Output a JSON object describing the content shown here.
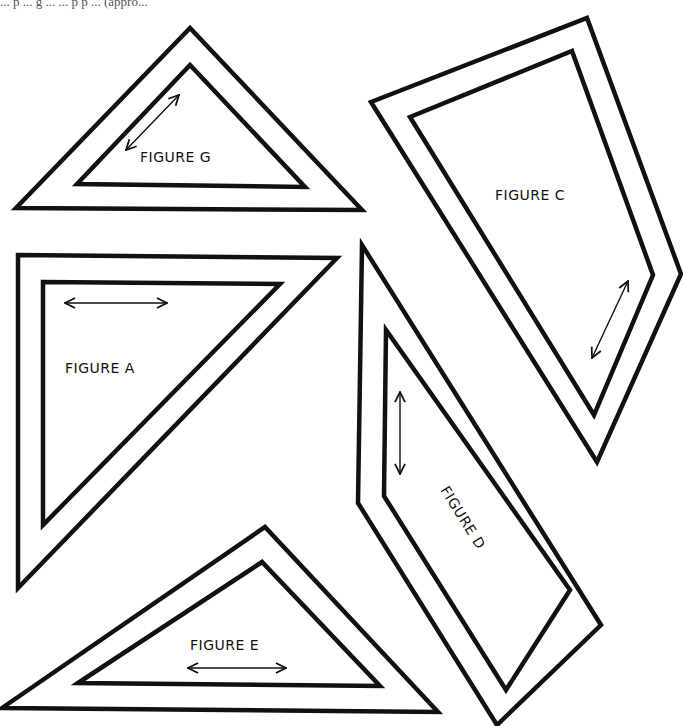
{
  "caption": "... p ... g ... ... p p ... (appro...",
  "colors": {
    "ink": "#111111",
    "paper": "#ffffff"
  },
  "figures": [
    {
      "id": "G",
      "label": "FIGURE G",
      "outer": "190,28 16,208 362,210",
      "inner": "190,65 77,184 305,187",
      "grainline": {
        "x1": 126,
        "y1": 150,
        "x2": 179,
        "y2": 95
      },
      "label_pos": {
        "x": 140,
        "y": 162,
        "rotate": 0
      }
    },
    {
      "id": "C",
      "label": "FIGURE C",
      "outer": "371,102 587,18 681,274 597,462",
      "inner": "410,117 572,51 653,275 594,415",
      "grainline": {
        "x1": 592,
        "y1": 358,
        "x2": 628,
        "y2": 281
      },
      "label_pos": {
        "x": 495,
        "y": 200,
        "rotate": 0
      }
    },
    {
      "id": "A",
      "label": "FIGURE A",
      "outer": "18,255 337,258 18,588",
      "inner": "43,282 280,284 43,525",
      "grainline": {
        "x1": 65,
        "y1": 303,
        "x2": 167,
        "y2": 303
      },
      "label_pos": {
        "x": 65,
        "y": 373,
        "rotate": 0
      }
    },
    {
      "id": "D",
      "label": "FIGURE D",
      "outer": "362,245 358,503 497,725 601,625",
      "inner": "386,330 384,496 506,690 570,590",
      "grainline": {
        "x1": 400,
        "y1": 392,
        "x2": 400,
        "y2": 474
      },
      "label_pos": {
        "x": 440,
        "y": 490,
        "rotate": 58
      }
    },
    {
      "id": "E",
      "label": "FIGURE E",
      "outer": "2,708 265,527 438,712",
      "inner": "78,683 262,562 380,686",
      "grainline": {
        "x1": 188,
        "y1": 668,
        "x2": 286,
        "y2": 668
      },
      "label_pos": {
        "x": 190,
        "y": 650,
        "rotate": 0
      }
    }
  ]
}
